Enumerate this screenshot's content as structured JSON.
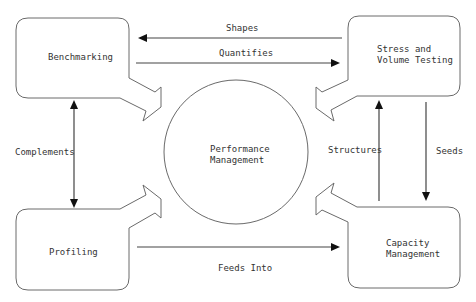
{
  "diagram": {
    "title": "",
    "center": {
      "label_line1": "Performance",
      "label_line2": "Management"
    },
    "nodes": {
      "benchmarking": {
        "label": "Benchmarking"
      },
      "stress": {
        "label_line1": "Stress and",
        "label_line2": "Volume Testing"
      },
      "profiling": {
        "label": "Profiling"
      },
      "capacity": {
        "label_line1": "Capacity",
        "label_line2": "Management"
      }
    },
    "edges": {
      "shapes": {
        "label": "Shapes",
        "from": "Stress and Volume Testing",
        "to": "Benchmarking"
      },
      "quantifies": {
        "label": "Quantifies",
        "from": "Benchmarking",
        "to": "Stress and Volume Testing"
      },
      "complements": {
        "label": "Complements",
        "from": "Benchmarking",
        "to": "Profiling",
        "bidirectional": true
      },
      "feeds_into": {
        "label": "Feeds Into",
        "from": "Profiling",
        "to": "Capacity Management"
      },
      "structures": {
        "label": "Structures",
        "from": "Capacity Management",
        "to": "Stress and Volume Testing"
      },
      "seeds": {
        "label": "Seeds",
        "from": "Stress and Volume Testing",
        "to": "Capacity Management"
      }
    },
    "colors": {
      "stroke": "#6a6a6a",
      "arrow": "#111111",
      "text": "#333333",
      "background": "#ffffff"
    }
  }
}
